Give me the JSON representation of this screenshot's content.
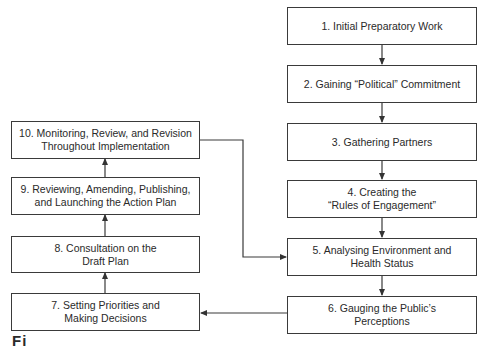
{
  "diagram": {
    "type": "flowchart",
    "steps": [
      {
        "id": 1,
        "label": "1. Initial Preparatory Work"
      },
      {
        "id": 2,
        "label": "2. Gaining “Political” Commitment"
      },
      {
        "id": 3,
        "label": "3. Gathering Partners"
      },
      {
        "id": 4,
        "label": "4. Creating the\n“Rules of Engagement”"
      },
      {
        "id": 5,
        "label": "5. Analysing Environment and\nHealth Status"
      },
      {
        "id": 6,
        "label": "6. Gauging the Public’s\nPerceptions"
      },
      {
        "id": 7,
        "label": "7. Setting Priorities and\nMaking Decisions"
      },
      {
        "id": 8,
        "label": "8. Consultation on the\nDraft Plan"
      },
      {
        "id": 9,
        "label": "9. Reviewing, Amending, Publishing,\nand Launching the Action Plan"
      },
      {
        "id": 10,
        "label": "10. Monitoring, Review, and Revision\nThroughout Implementation"
      }
    ],
    "edges": [
      {
        "from": 1,
        "to": 2
      },
      {
        "from": 2,
        "to": 3
      },
      {
        "from": 3,
        "to": 4
      },
      {
        "from": 4,
        "to": 5
      },
      {
        "from": 5,
        "to": 6
      },
      {
        "from": 6,
        "to": 7
      },
      {
        "from": 7,
        "to": 8
      },
      {
        "from": 8,
        "to": 9
      },
      {
        "from": 9,
        "to": 10
      },
      {
        "from": 10,
        "to": 5
      }
    ],
    "caption_fragment": "Fi"
  },
  "colors": {
    "line": "#3a3a3a",
    "background": "#ffffff"
  }
}
